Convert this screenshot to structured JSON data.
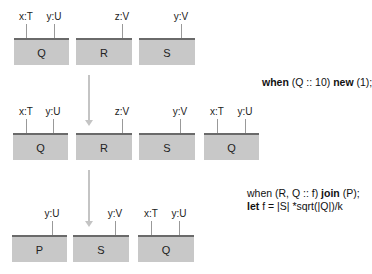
{
  "rows": [
    {
      "boxes": [
        {
          "name": "Q",
          "left": 14,
          "width": 55,
          "attrs": [
            {
              "label": "x:T",
              "x": 26
            },
            {
              "label": "y:U",
              "x": 54
            }
          ]
        },
        {
          "name": "R",
          "left": 76,
          "width": 56,
          "attrs": [
            {
              "label": "z:V",
              "x": 122
            }
          ]
        },
        {
          "name": "S",
          "left": 139,
          "width": 56,
          "attrs": [
            {
              "label": "y:V",
              "x": 181
            }
          ]
        }
      ]
    },
    {
      "boxes": [
        {
          "name": "Q",
          "left": 13,
          "width": 55,
          "attrs": [
            {
              "label": "x:T",
              "x": 26
            },
            {
              "label": "y:U",
              "x": 53
            }
          ]
        },
        {
          "name": "R",
          "left": 76,
          "width": 56,
          "attrs": [
            {
              "label": "z:V",
              "x": 122
            }
          ]
        },
        {
          "name": "S",
          "left": 139,
          "width": 56,
          "attrs": [
            {
              "label": "y:V",
              "x": 180
            }
          ]
        },
        {
          "name": "Q",
          "left": 204,
          "width": 55,
          "attrs": [
            {
              "label": "x:T",
              "x": 217
            },
            {
              "label": "y:U",
              "x": 245
            }
          ]
        }
      ]
    },
    {
      "boxes": [
        {
          "name": "P",
          "left": 12,
          "width": 55,
          "attrs": [
            {
              "label": "y:U",
              "x": 52
            }
          ]
        },
        {
          "name": "S",
          "left": 73,
          "width": 56,
          "attrs": [
            {
              "label": "y:V",
              "x": 115
            }
          ]
        },
        {
          "name": "Q",
          "left": 138,
          "width": 56,
          "attrs": [
            {
              "label": "x:T",
              "x": 151
            },
            {
              "label": "y:U",
              "x": 179
            }
          ]
        }
      ]
    }
  ],
  "code": {
    "step1": {
      "kw1": "when",
      "a": " (Q :: 10) ",
      "kw2": "new",
      "b": " (1);"
    },
    "step2_line1": {
      "a": "when (R, Q :: f) ",
      "kw": "join",
      "b": " (P);"
    },
    "step2_line2": {
      "kw": "let",
      "b": " f = |S| *sqrt(|Q|)/k"
    }
  },
  "colors": {
    "box_fill": "#c8c8c8",
    "box_top": "#6a6a6a",
    "arrow": "#c4c4c4"
  }
}
